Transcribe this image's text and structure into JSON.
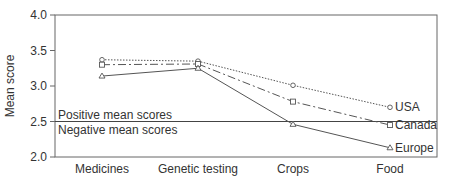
{
  "chart_data": {
    "type": "line",
    "title": "",
    "xlabel": "",
    "ylabel": "Mean score",
    "ylim": [
      2.0,
      4.0
    ],
    "yticks": [
      "2.0",
      "2.5",
      "3.0",
      "3.5",
      "4.0"
    ],
    "categories": [
      "Medicines",
      "Genetic testing",
      "Crops",
      "Food"
    ],
    "series": [
      {
        "name": "USA",
        "marker": "circle",
        "linestyle": "dotted",
        "values": [
          3.37,
          3.35,
          3.01,
          2.7
        ]
      },
      {
        "name": "Canada",
        "marker": "square",
        "linestyle": "dash-dot",
        "values": [
          3.3,
          3.31,
          2.78,
          2.45
        ]
      },
      {
        "name": "Europe",
        "marker": "triangle",
        "linestyle": "solid",
        "values": [
          3.14,
          3.25,
          2.46,
          2.13
        ]
      }
    ],
    "reference_line": {
      "y": 2.5,
      "label_above": "Positive mean scores",
      "label_below": "Negative mean scores"
    },
    "grid": false,
    "legend": "direct labels at line ends"
  },
  "colors": {
    "line": "#555555",
    "axis": "#444444",
    "text": "#333333"
  }
}
